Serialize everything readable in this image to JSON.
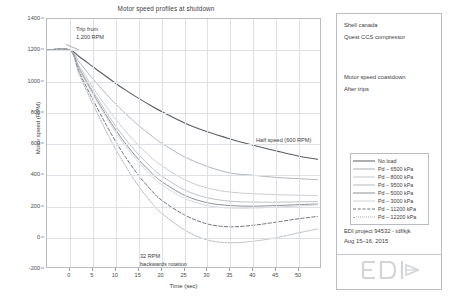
{
  "chart_data": {
    "type": "line",
    "title": "Motor speed profiles at shutdown",
    "xlabel": "Time (sec)",
    "ylabel": "Motor speed (RPM)",
    "xlim": [
      -5,
      55
    ],
    "ylim": [
      -200,
      1400
    ],
    "xticks": [
      0,
      5,
      10,
      15,
      20,
      25,
      30,
      35,
      40,
      45,
      50
    ],
    "yticks": [
      -200,
      0,
      200,
      400,
      600,
      800,
      1000,
      1200,
      1400
    ],
    "grid": true,
    "legend_position": "right-panel",
    "x": [
      -5,
      0,
      2,
      5,
      8,
      10,
      12,
      15,
      18,
      20,
      25,
      30,
      35,
      40,
      45,
      50,
      54
    ],
    "series": [
      {
        "name": "No load",
        "color": "#5a5e63",
        "width": 1.15,
        "dash": "solid",
        "values": [
          1200,
          1200,
          1160,
          1095,
          1030,
          988,
          948,
          892,
          840,
          808,
          735,
          678,
          632,
          592,
          556,
          522,
          502
        ]
      },
      {
        "name": "Pd – 6500 kPa",
        "color": "#a9adb2",
        "width": 0.9,
        "dash": "solid",
        "values": [
          1200,
          1200,
          1125,
          1018,
          918,
          856,
          798,
          718,
          648,
          606,
          518,
          456,
          414,
          400,
          386,
          378,
          372
        ]
      },
      {
        "name": "Pd – 8000 kPa",
        "color": "#c4c7cb",
        "width": 0.9,
        "dash": "solid",
        "values": [
          1200,
          1200,
          1100,
          962,
          836,
          758,
          686,
          590,
          508,
          462,
          372,
          318,
          292,
          282,
          276,
          272,
          270
        ]
      },
      {
        "name": "Pd – 9500 kPa",
        "color": "#b7babe",
        "width": 0.9,
        "dash": "solid",
        "values": [
          1200,
          1200,
          1088,
          940,
          800,
          714,
          636,
          532,
          444,
          396,
          306,
          256,
          234,
          228,
          228,
          230,
          232
        ]
      },
      {
        "name": "Pd – 5000 kPa",
        "color": "#8d9196",
        "width": 1.0,
        "dash": "solid",
        "values": [
          1200,
          1200,
          1082,
          926,
          780,
          690,
          608,
          500,
          410,
          360,
          272,
          224,
          206,
          202,
          206,
          212,
          216
        ]
      },
      {
        "name": "Pd – 3000 kPa",
        "color": "#cfd2d6",
        "width": 0.9,
        "dash": "solid",
        "values": [
          1200,
          1200,
          1078,
          918,
          768,
          676,
          592,
          482,
          390,
          340,
          252,
          206,
          190,
          190,
          196,
          204,
          210
        ]
      },
      {
        "name": "Pd – 11200 kPa",
        "color": "#6e7378",
        "width": 1.0,
        "dash": "dashed",
        "values": [
          1200,
          1200,
          1062,
          884,
          718,
          616,
          522,
          398,
          296,
          240,
          146,
          88,
          70,
          80,
          100,
          122,
          136
        ]
      },
      {
        "name": "Pd – 12200 kPa",
        "color": "#a6a9ad",
        "width": 0.9,
        "dash": "dotted",
        "values": [
          1200,
          1200,
          1048,
          856,
          676,
          566,
          466,
          330,
          218,
          158,
          50,
          -14,
          -32,
          -22,
          0,
          32,
          56
        ]
      }
    ],
    "annotations": [
      {
        "name": "trip-annotation",
        "text": "Trip from\n1,200 RPM"
      },
      {
        "name": "half-speed-annotation",
        "text": "Half speed (600 RPM)"
      },
      {
        "name": "backwards-annotation",
        "text": "32 RPM\nbackwards rotation"
      }
    ]
  },
  "info_panel": {
    "client": "Shell canada",
    "project": "Quest CCS compressor",
    "subject": "Motor speed coastdown",
    "condition": "After trips",
    "project_ref": "EDI project 94532 - tdf/kjk",
    "date": "Aug 15–16, 2015",
    "logo_text": "EDI"
  }
}
